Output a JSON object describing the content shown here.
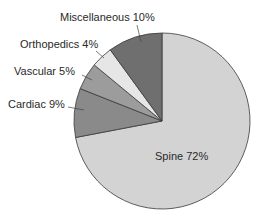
{
  "chart_data": {
    "type": "pie",
    "title": "",
    "categories": [
      "Spine",
      "Cardiac",
      "Vascular",
      "Orthopedics",
      "Miscellaneous"
    ],
    "values": [
      72,
      9,
      5,
      4,
      10
    ],
    "unit": "%",
    "colors": [
      "#d3d3d3",
      "#8a8a8a",
      "#9c9c9c",
      "#e6e6e6",
      "#6f6f6f"
    ],
    "start_angle": "12 o'clock, clockwise",
    "legend": "none (direct labels)"
  },
  "labels": {
    "spine": "Spine 72%",
    "cardiac": "Cardiac 9%",
    "vascular": "Vascular 5%",
    "orthopedics": "Orthopedics 4%",
    "miscellaneous": "Miscellaneous 10%"
  }
}
